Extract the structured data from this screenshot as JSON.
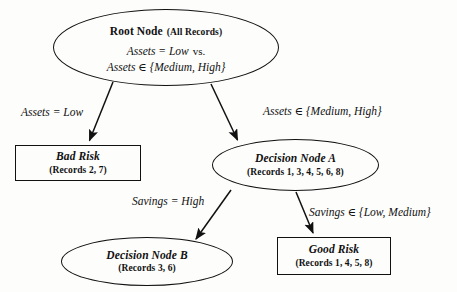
{
  "diagram": {
    "background_color": "#fdfdfc",
    "stroke_color": "#111111"
  },
  "nodes": {
    "root": {
      "name": "Root Node",
      "records": "(All Records)",
      "rule_line1": "Assets = Low",
      "rule_line1_suffix": "vs.",
      "rule_line2": "Assets ∈ {Medium, High}"
    },
    "bad_risk": {
      "name": "Bad Risk",
      "records": "(Records 2, 7)"
    },
    "decision_a": {
      "name": "Decision Node A",
      "records": "(Records 1, 3, 4, 5, 6, 8)"
    },
    "decision_b": {
      "name": "Decision Node B",
      "records": "(Records 3, 6)"
    },
    "good_risk": {
      "name": "Good Risk",
      "records": "(Records 1, 4, 5, 8)"
    }
  },
  "edges": {
    "root_to_bad_risk": "Assets = Low",
    "root_to_decision_a": "Assets ∈ {Medium, High}",
    "decision_a_to_decision_b": "Savings = High",
    "decision_a_to_good_risk": "Savings ∈ {Low, Medium}"
  }
}
